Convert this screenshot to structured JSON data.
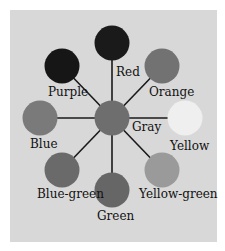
{
  "diagram": {
    "title": "",
    "center": {
      "label": "Gray",
      "color": "#6e6e6e"
    },
    "nodes": [
      {
        "label": "Red",
        "color": "#1a1a1a"
      },
      {
        "label": "Orange",
        "color": "#727272"
      },
      {
        "label": "Yellow",
        "color": "#efefef"
      },
      {
        "label": "Yellow-green",
        "color": "#9a9a9a"
      },
      {
        "label": "Green",
        "color": "#666666"
      },
      {
        "label": "Blue-green",
        "color": "#6a6a6a"
      },
      {
        "label": "Blue",
        "color": "#7a7a7a"
      },
      {
        "label": "Purple",
        "color": "#161616"
      }
    ],
    "background": "#d8d8d8",
    "line_color": "#1a1a1a"
  }
}
